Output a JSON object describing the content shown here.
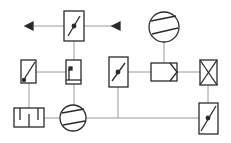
{
  "diagram": {
    "type": "hvac-schematic",
    "colors": {
      "stroke": "#2a2a2a",
      "line": "#9a9a9a",
      "background": "#ffffff"
    },
    "components": [
      {
        "id": "top-damper",
        "kind": "damper"
      },
      {
        "id": "exhaust-arrow",
        "kind": "arrow-out"
      },
      {
        "id": "intake-arrow",
        "kind": "arrow-in"
      },
      {
        "id": "top-fan",
        "kind": "fan"
      },
      {
        "id": "left-filter",
        "kind": "filter"
      },
      {
        "id": "sensor-box",
        "kind": "sensor"
      },
      {
        "id": "middle-damper",
        "kind": "damper"
      },
      {
        "id": "heat-exchanger",
        "kind": "heat-exchanger"
      },
      {
        "id": "cross-box",
        "kind": "heater-cooler"
      },
      {
        "id": "humidifier",
        "kind": "humidifier"
      },
      {
        "id": "bottom-fan",
        "kind": "fan"
      },
      {
        "id": "bottom-right-damper",
        "kind": "damper"
      }
    ]
  }
}
